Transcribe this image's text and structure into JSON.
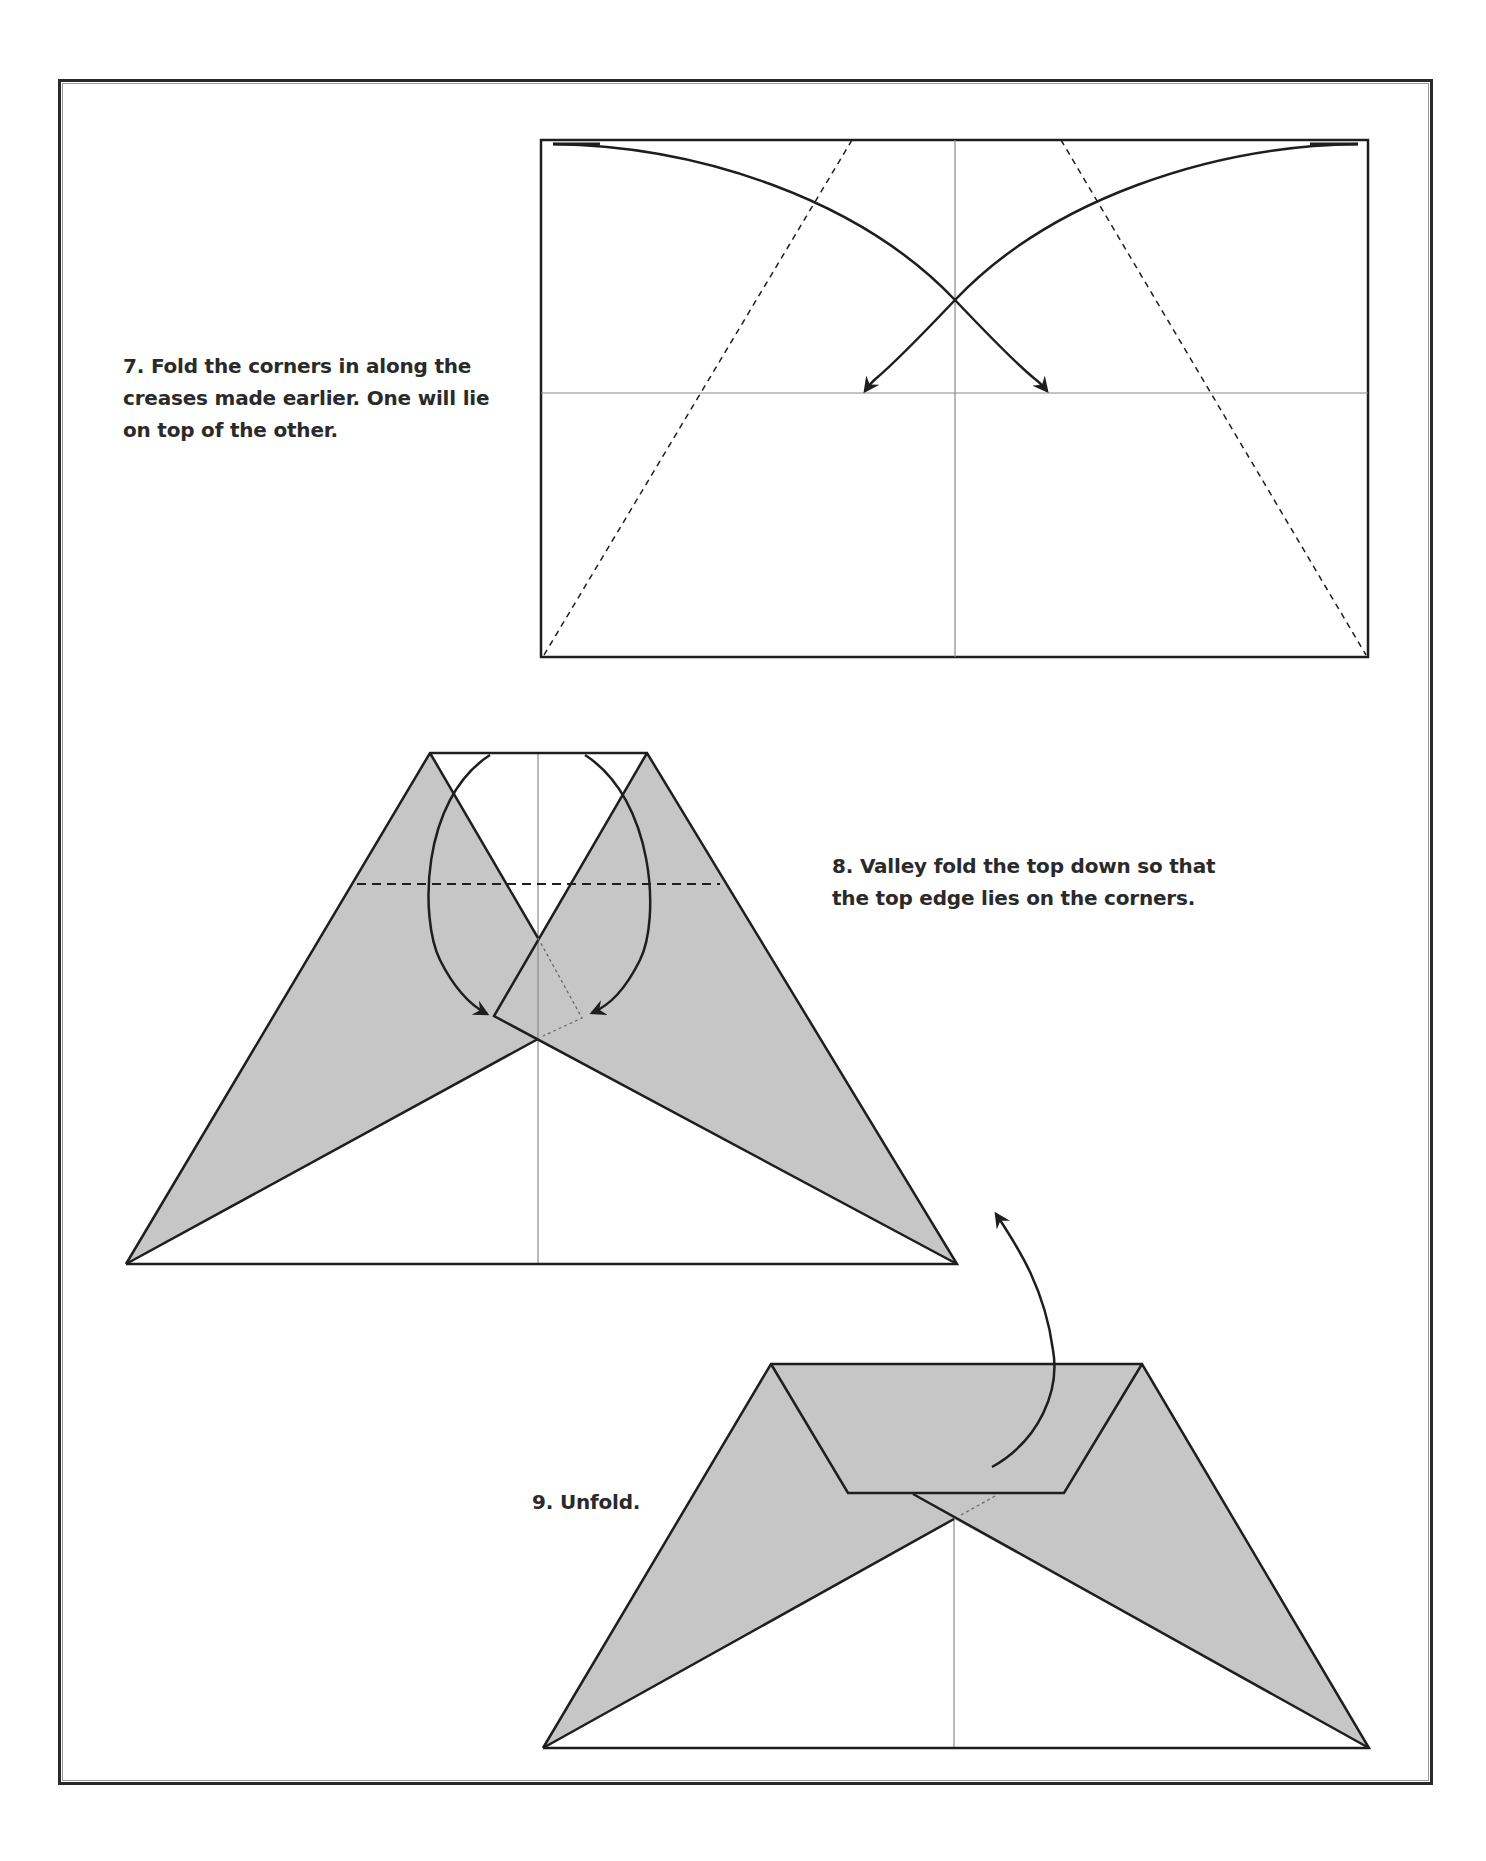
{
  "page": {
    "type": "origami-instructions",
    "colors": {
      "paper_white": "#ffffff",
      "paper_shaded": "#c6c6c6",
      "line": "#1e1e1e",
      "crease": "#8a8a8a",
      "text": "#2a2a2a"
    }
  },
  "steps": [
    {
      "number": "7",
      "lines": [
        "7. Fold the corners in along the",
        "creases made earlier. One will lie",
        "on top of the other."
      ],
      "diagram": "rectangle-with-corner-fold-arrows"
    },
    {
      "number": "8",
      "lines": [
        "8. Valley fold the top down so that",
        "the top edge lies on the corners."
      ],
      "diagram": "folded-corners-with-valley-fold-line"
    },
    {
      "number": "9",
      "lines": [
        "9. Unfold."
      ],
      "diagram": "folded-top-with-unfold-arrow"
    }
  ]
}
